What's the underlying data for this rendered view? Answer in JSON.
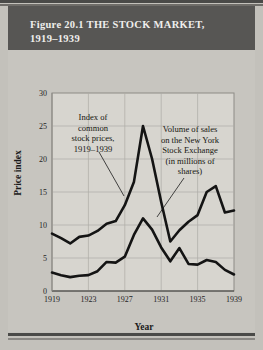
{
  "figure": {
    "title_line1": "Figure 20.1 THE STOCK MARKET,",
    "title_line2": "1919–1939",
    "title_bar_color": "#575654",
    "page_background": "#c7c5bf",
    "plot_background": "#d7d5cf",
    "line_color": "#141414"
  },
  "chart_data": {
    "type": "line",
    "title": "Figure 20.1 THE STOCK MARKET, 1919–1939",
    "xlabel": "Year",
    "ylabel": "Price index",
    "xlim": [
      1919,
      1939
    ],
    "ylim": [
      0,
      30
    ],
    "xticks": [
      "1919",
      "1923",
      "1927",
      "1931",
      "1935",
      "1939"
    ],
    "yticks": [
      "0",
      "5",
      "10",
      "15",
      "20",
      "25",
      "30"
    ],
    "grid": true,
    "legend": "none",
    "x": [
      1919,
      1920,
      1921,
      1922,
      1923,
      1924,
      1925,
      1926,
      1927,
      1928,
      1929,
      1930,
      1931,
      1932,
      1933,
      1934,
      1935,
      1936,
      1937,
      1938,
      1939
    ],
    "series": [
      {
        "name": "Index of common stock prices, 1919–1939",
        "values": [
          8.7,
          8.0,
          7.2,
          8.2,
          8.4,
          9.1,
          10.2,
          10.6,
          13.0,
          16.5,
          25.0,
          20.0,
          13.5,
          7.5,
          9.2,
          10.5,
          11.5,
          15.0,
          15.9,
          11.9,
          12.2
        ]
      },
      {
        "name": "Volume of sales on the New York Stock Exchange (in millions of shares)",
        "values": [
          2.8,
          2.4,
          2.1,
          2.3,
          2.4,
          3.0,
          4.4,
          4.3,
          5.2,
          8.5,
          11.0,
          9.3,
          6.6,
          4.5,
          6.5,
          4.1,
          4.0,
          4.7,
          4.4,
          3.2,
          2.5
        ]
      }
    ],
    "annotations": [
      {
        "id": "annotation-stock-prices",
        "lines": [
          "Index of",
          "common",
          "stock prices,",
          "1919–1939"
        ]
      },
      {
        "id": "annotation-volume",
        "lines": [
          "Volume of sales",
          "on the New York",
          "Stock Exchange",
          "(in millions of",
          "shares)"
        ]
      }
    ]
  }
}
